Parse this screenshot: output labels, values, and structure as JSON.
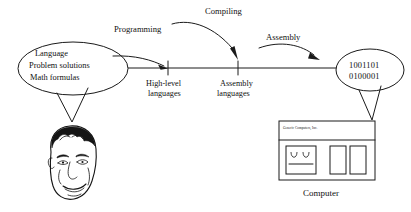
{
  "diagram": {
    "background_color": "#ffffff",
    "ink_color": "#1a1a1a"
  },
  "source_node": {
    "name": "human-language-ellipse",
    "lines": [
      "Language",
      "Problem solutions",
      "Math formulas"
    ]
  },
  "target_node": {
    "name": "machine-code-ellipse",
    "lines": [
      "1001101",
      "0100001"
    ]
  },
  "arcs": [
    {
      "label": "Programming",
      "from": "human-language-ellipse",
      "to": "high-level-languages"
    },
    {
      "label": "Compiling",
      "from": "high-level-languages",
      "to": "assembly-languages"
    },
    {
      "label": "Assembly",
      "from": "assembly-languages",
      "to": "machine-code-ellipse"
    }
  ],
  "axis_ticks": [
    {
      "name": "high-level-languages",
      "line1": "High-level",
      "line2": "languages"
    },
    {
      "name": "assembly-languages",
      "line1": "Assembly",
      "line2": "languages"
    }
  ],
  "human_illustration": {
    "name": "programmer-face",
    "description": "line drawing of a man's face"
  },
  "computer_illustration": {
    "name": "computer-case",
    "brand_label": "Generic Computers, Inc.",
    "caption": "Computer"
  }
}
